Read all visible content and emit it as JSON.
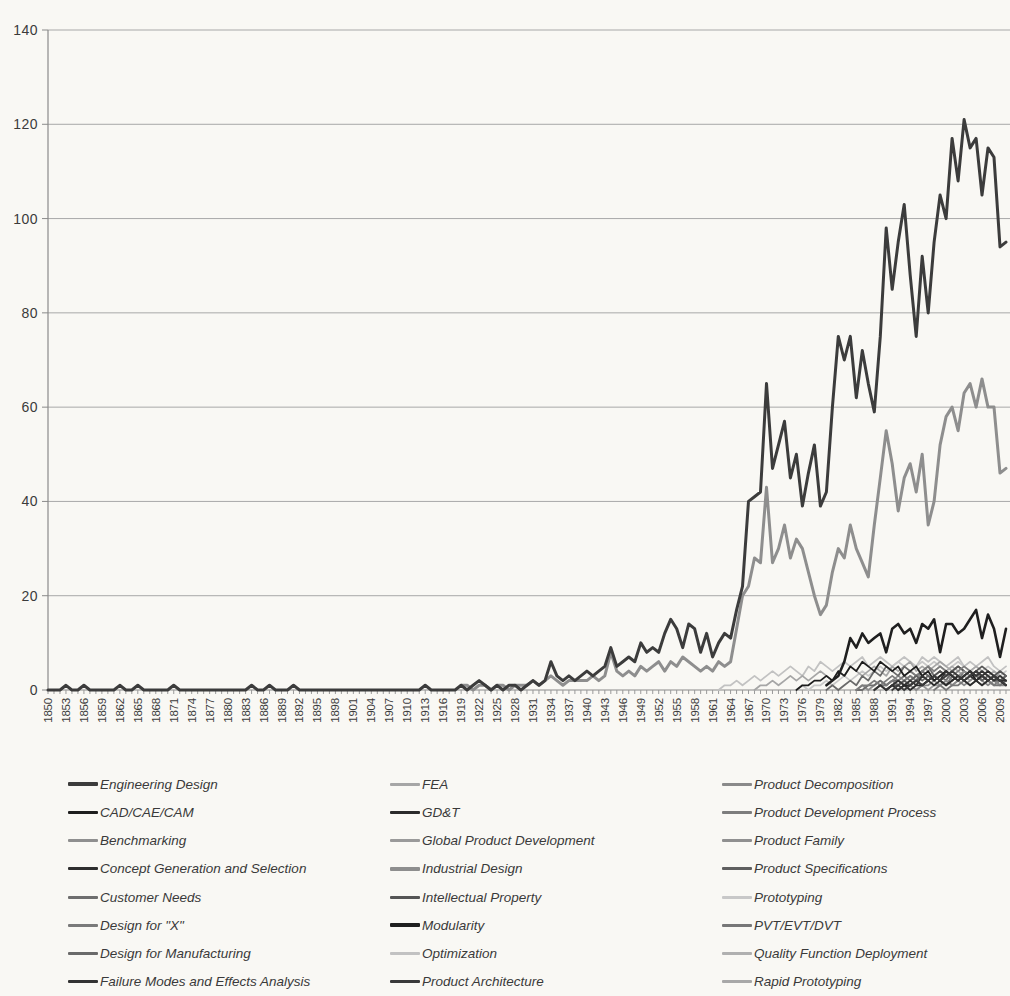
{
  "chart_data": {
    "type": "line",
    "title": "",
    "xlabel": "",
    "ylabel": "",
    "ylim": [
      0,
      140
    ],
    "y_ticks": [
      0,
      20,
      40,
      60,
      80,
      100,
      120,
      140
    ],
    "x_start_year": 1850,
    "x_end_year": 2010,
    "x_tick_years": [
      1850,
      1853,
      1856,
      1859,
      1862,
      1865,
      1868,
      1871,
      1874,
      1877,
      1880,
      1883,
      1886,
      1889,
      1892,
      1895,
      1898,
      1901,
      1904,
      1907,
      1910,
      1913,
      1916,
      1919,
      1922,
      1925,
      1928,
      1931,
      1934,
      1937,
      1940,
      1943,
      1946,
      1949,
      1952,
      1955,
      1958,
      1961,
      1964,
      1967,
      1970,
      1973,
      1976,
      1979,
      1982,
      1985,
      1988,
      1991,
      1994,
      1997,
      2000,
      2003,
      2006,
      2009
    ],
    "grid": "horizontal",
    "legend_position": "bottom",
    "legend_columns": 3,
    "series": [
      {
        "name": "Engineering Design",
        "color": "#3c3c3c",
        "width": 3,
        "z": 9,
        "start_year": 1850,
        "values": [
          0,
          0,
          0,
          1,
          0,
          0,
          1,
          0,
          0,
          0,
          0,
          0,
          1,
          0,
          0,
          1,
          0,
          0,
          0,
          0,
          0,
          1,
          0,
          0,
          0,
          0,
          0,
          0,
          0,
          0,
          0,
          0,
          0,
          0,
          1,
          0,
          0,
          1,
          0,
          0,
          0,
          1,
          0,
          0,
          0,
          0,
          0,
          0,
          0,
          0,
          0,
          0,
          0,
          0,
          0,
          0,
          0,
          0,
          0,
          0,
          0,
          0,
          0,
          1,
          0,
          0,
          0,
          0,
          0,
          1,
          0,
          1,
          2,
          1,
          0,
          1,
          0,
          1,
          1,
          0,
          1,
          2,
          1,
          2,
          6,
          3,
          2,
          3,
          2,
          3,
          4,
          3,
          4,
          5,
          9,
          5,
          6,
          7,
          6,
          10,
          8,
          9,
          8,
          12,
          15,
          13,
          9,
          14,
          13,
          8,
          12,
          7,
          10,
          12,
          11,
          17,
          22,
          40,
          41,
          42,
          65,
          47,
          52,
          57,
          45,
          50,
          39,
          46,
          52,
          39,
          42,
          60,
          75,
          70,
          75,
          62,
          72,
          65,
          59,
          75,
          98,
          85,
          95,
          103,
          88,
          75,
          92,
          80,
          95,
          105,
          100,
          117,
          108,
          121,
          115,
          117,
          105,
          115,
          113,
          94,
          95
        ]
      },
      {
        "name": "CAD/CAE/CAM",
        "color": "#1e1e1e",
        "width": 1.8,
        "z": 4,
        "start_year": 1975,
        "values": [
          0,
          1,
          1,
          2,
          2,
          3,
          2,
          4,
          3,
          5,
          4,
          6,
          5,
          4,
          6,
          5,
          4,
          5,
          3,
          4,
          5,
          3,
          4,
          2,
          3,
          4,
          3,
          2,
          3,
          4,
          2,
          3,
          2,
          3,
          2,
          1
        ]
      },
      {
        "name": "Benchmarking",
        "color": "#8f8f8f",
        "width": 1.8,
        "z": 3,
        "start_year": 1985,
        "values": [
          0,
          1,
          0,
          1,
          2,
          1,
          2,
          3,
          2,
          3,
          2,
          4,
          3,
          2,
          3,
          4,
          2,
          3,
          2,
          3,
          4,
          3,
          2,
          3,
          2,
          1
        ]
      },
      {
        "name": "Concept Generation and Selection",
        "color": "#2e2e2e",
        "width": 1.8,
        "z": 4,
        "start_year": 1990,
        "values": [
          0,
          1,
          0,
          1,
          1,
          2,
          1,
          2,
          3,
          2,
          1,
          2,
          3,
          2,
          3,
          2,
          3,
          4,
          3,
          2,
          2
        ]
      },
      {
        "name": "Customer Needs",
        "color": "#6e6e6e",
        "width": 1.8,
        "z": 3,
        "start_year": 1985,
        "values": [
          0,
          0,
          1,
          1,
          2,
          1,
          2,
          2,
          3,
          2,
          3,
          4,
          3,
          2,
          3,
          2,
          4,
          3,
          2,
          3,
          4,
          2,
          3,
          2,
          1,
          2
        ]
      },
      {
        "name": "Design for \"X\"",
        "color": "#7a7a7a",
        "width": 1.8,
        "z": 3,
        "start_year": 1988,
        "values": [
          0,
          1,
          1,
          2,
          1,
          2,
          3,
          2,
          1,
          2,
          3,
          2,
          1,
          3,
          2,
          4,
          3,
          2,
          3,
          2,
          1,
          2,
          3
        ]
      },
      {
        "name": "Design for Manufacturing",
        "color": "#6a6a6a",
        "width": 1.8,
        "z": 3,
        "start_year": 1980,
        "values": [
          0,
          1,
          0,
          1,
          2,
          1,
          3,
          2,
          4,
          3,
          5,
          4,
          3,
          5,
          4,
          3,
          4,
          5,
          3,
          4,
          3,
          4,
          5,
          4,
          3,
          4,
          3,
          2,
          3,
          2,
          3
        ]
      },
      {
        "name": "Failure Modes and Effects Analysis",
        "color": "#333333",
        "width": 1.8,
        "z": 4,
        "start_year": 1988,
        "values": [
          0,
          1,
          0,
          1,
          2,
          1,
          2,
          1,
          3,
          2,
          3,
          2,
          4,
          3,
          2,
          3,
          4,
          3,
          4,
          3,
          2,
          3,
          2
        ]
      },
      {
        "name": "FEA",
        "color": "#a6a6a6",
        "width": 1.8,
        "z": 2,
        "start_year": 1968,
        "values": [
          0,
          1,
          1,
          2,
          1,
          2,
          3,
          2,
          3,
          2,
          3,
          4,
          3,
          2,
          4,
          3,
          5,
          4,
          3,
          4,
          5,
          4,
          3,
          5,
          4,
          5,
          6,
          4,
          5,
          4,
          5,
          6,
          5,
          4,
          5,
          4,
          3,
          4,
          3,
          2,
          3,
          4,
          3
        ]
      },
      {
        "name": "GD&T",
        "color": "#2b2b2b",
        "width": 1.8,
        "z": 4,
        "start_year": 1992,
        "values": [
          0,
          1,
          0,
          1,
          1,
          2,
          1,
          2,
          1,
          2,
          3,
          2,
          1,
          2,
          1,
          2,
          3,
          2,
          1
        ]
      },
      {
        "name": "Global Product Development",
        "color": "#9a9a9a",
        "width": 1.8,
        "z": 2,
        "start_year": 1995,
        "values": [
          0,
          1,
          0,
          1,
          1,
          2,
          1,
          2,
          3,
          2,
          3,
          4,
          3,
          2,
          4,
          3
        ]
      },
      {
        "name": "Industrial Design",
        "color": "#8e8e8e",
        "width": 3,
        "z": 7,
        "start_year": 1919,
        "values": [
          1,
          1,
          0,
          1,
          1,
          0,
          1,
          1,
          0,
          1,
          1,
          1,
          2,
          1,
          2,
          3,
          2,
          1,
          2,
          2,
          2,
          2,
          3,
          2,
          3,
          8,
          4,
          3,
          4,
          3,
          5,
          4,
          5,
          6,
          4,
          6,
          5,
          7,
          6,
          5,
          4,
          5,
          4,
          6,
          5,
          6,
          13,
          20,
          22,
          28,
          27,
          43,
          27,
          30,
          35,
          28,
          32,
          30,
          25,
          20,
          16,
          18,
          25,
          30,
          28,
          35,
          30,
          27,
          24,
          35,
          45,
          55,
          48,
          38,
          45,
          48,
          42,
          50,
          35,
          40,
          52,
          58,
          60,
          55,
          63,
          65,
          60,
          66,
          60,
          60,
          46,
          47
        ]
      },
      {
        "name": "Intellectual Property",
        "color": "#555555",
        "width": 1.8,
        "z": 3,
        "start_year": 1990,
        "values": [
          0,
          1,
          1,
          2,
          1,
          2,
          3,
          2,
          3,
          4,
          3,
          4,
          5,
          4,
          3,
          4,
          5,
          4,
          3,
          4,
          3
        ]
      },
      {
        "name": "Modularity",
        "color": "#1f1f1f",
        "width": 2.6,
        "z": 8,
        "start_year": 1980,
        "values": [
          1,
          2,
          3,
          6,
          11,
          9,
          12,
          10,
          11,
          12,
          8,
          13,
          14,
          12,
          13,
          10,
          14,
          13,
          15,
          8,
          14,
          14,
          12,
          13,
          15,
          17,
          11,
          16,
          13,
          7,
          13
        ]
      },
      {
        "name": "Optimization",
        "color": "#c2c2c2",
        "width": 1.8,
        "z": 1,
        "start_year": 1962,
        "values": [
          0,
          1,
          1,
          2,
          1,
          2,
          3,
          2,
          3,
          4,
          3,
          4,
          5,
          4,
          3,
          5,
          4,
          6,
          5,
          4,
          5,
          6,
          5,
          6,
          7,
          5,
          6,
          7,
          6,
          5,
          6,
          7,
          6,
          5,
          7,
          6,
          7,
          6,
          5,
          6,
          7,
          5,
          6,
          5,
          6,
          7,
          5,
          4,
          5
        ]
      },
      {
        "name": "Product Architecture",
        "color": "#3a3a3a",
        "width": 1.8,
        "z": 4,
        "start_year": 1991,
        "values": [
          0,
          1,
          0,
          1,
          2,
          1,
          2,
          3,
          2,
          3,
          4,
          3,
          2,
          3,
          4,
          3,
          2,
          3,
          2,
          1
        ]
      },
      {
        "name": "Product Decomposition",
        "color": "#8a8a8a",
        "width": 1.8,
        "z": 3,
        "start_year": 1993,
        "values": [
          0,
          1,
          0,
          1,
          1,
          2,
          1,
          2,
          1,
          2,
          1,
          2,
          3,
          2,
          1,
          2,
          1,
          1
        ]
      },
      {
        "name": "Product Development Process",
        "color": "#7d7d7d",
        "width": 1.8,
        "z": 3,
        "start_year": 1985,
        "values": [
          0,
          1,
          1,
          2,
          1,
          2,
          3,
          2,
          3,
          4,
          3,
          4,
          5,
          4,
          5,
          4,
          3,
          4,
          5,
          4,
          3,
          4,
          3,
          2,
          3,
          2
        ]
      },
      {
        "name": "Product Family",
        "color": "#909090",
        "width": 1.8,
        "z": 3,
        "start_year": 1992,
        "values": [
          0,
          1,
          1,
          2,
          1,
          2,
          3,
          2,
          3,
          4,
          3,
          4,
          3,
          2,
          3,
          4,
          3,
          2,
          3
        ]
      },
      {
        "name": "Product Specifications",
        "color": "#5f5f5f",
        "width": 1.8,
        "z": 3,
        "start_year": 1988,
        "values": [
          0,
          1,
          0,
          1,
          2,
          1,
          2,
          3,
          2,
          3,
          2,
          3,
          4,
          3,
          2,
          3,
          4,
          3,
          2,
          3,
          2,
          2,
          3
        ]
      },
      {
        "name": "Prototyping",
        "color": "#c8c8c8",
        "width": 1.8,
        "z": 1,
        "start_year": 1975,
        "values": [
          0,
          1,
          0,
          1,
          1,
          2,
          1,
          2,
          3,
          2,
          3,
          4,
          3,
          4,
          5,
          4,
          5,
          6,
          5,
          4,
          5,
          6,
          5,
          6,
          5,
          4,
          5,
          6,
          5,
          4,
          5,
          4,
          5,
          4,
          3,
          4
        ]
      },
      {
        "name": "PVT/EVT/DVT",
        "color": "#777777",
        "width": 1.8,
        "z": 3,
        "start_year": 1998,
        "values": [
          0,
          1,
          0,
          1,
          1,
          2,
          1,
          2,
          1,
          2,
          1,
          1,
          2
        ]
      },
      {
        "name": "Quality Function Deployment",
        "color": "#b0b0b0",
        "width": 1.8,
        "z": 2,
        "start_year": 1988,
        "values": [
          0,
          1,
          1,
          2,
          1,
          2,
          3,
          2,
          3,
          2,
          3,
          4,
          3,
          2,
          3,
          2,
          3,
          2,
          3,
          2,
          1,
          2,
          2
        ]
      },
      {
        "name": "Rapid Prototyping",
        "color": "#a8a8a8",
        "width": 1.8,
        "z": 2,
        "start_year": 1990,
        "values": [
          0,
          1,
          1,
          2,
          3,
          2,
          4,
          3,
          4,
          5,
          4,
          5,
          4,
          3,
          4,
          5,
          4,
          3,
          4,
          3,
          2
        ]
      }
    ]
  },
  "axes_style": {
    "grid_color": "#a8a8a8",
    "axis_color": "#8a8a8a",
    "tick_color": "#9a9a9a",
    "label_color": "#3b3b3b"
  }
}
